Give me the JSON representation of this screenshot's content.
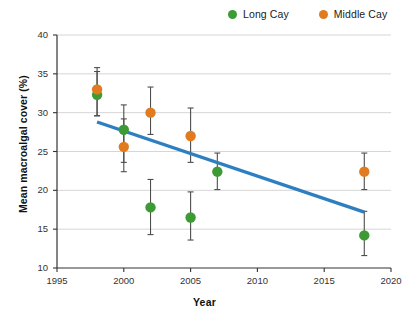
{
  "chart_data": {
    "type": "scatter",
    "title": "",
    "xlabel": "Year",
    "ylabel": "Mean macroalgal cover (%)",
    "xlim": [
      1995,
      2020
    ],
    "ylim": [
      10,
      40
    ],
    "xticks": [
      1995,
      2000,
      2005,
      2010,
      2015,
      2020
    ],
    "yticks": [
      10,
      15,
      20,
      25,
      30,
      35,
      40
    ],
    "grid": "horizontal",
    "legend_position": "top-right",
    "colors": {
      "long_cay": "#3d9b35",
      "middle_cay": "#e07b1f",
      "trendline": "#2e7fc1",
      "errorbar": "#4d4d4d",
      "gridline": "#cccccc",
      "axis": "#333333"
    },
    "series": [
      {
        "name": "Long Cay",
        "color": "#3d9b35",
        "points": [
          {
            "x": 1998,
            "y": 32.3,
            "err_low": 29.6,
            "err_high": 35.3
          },
          {
            "x": 2000,
            "y": 27.8,
            "err_low": 23.6,
            "err_high": 31.0
          },
          {
            "x": 2002,
            "y": 17.8,
            "err_low": 14.3,
            "err_high": 21.4
          },
          {
            "x": 2005,
            "y": 16.5,
            "err_low": 13.6,
            "err_high": 19.8
          },
          {
            "x": 2007,
            "y": 22.4,
            "err_low": 20.1,
            "err_high": 24.8
          },
          {
            "x": 2018,
            "y": 14.2,
            "err_low": 11.6,
            "err_high": 17.3
          }
        ]
      },
      {
        "name": "Middle Cay",
        "color": "#e07b1f",
        "points": [
          {
            "x": 1998,
            "y": 33.0,
            "err_low": 29.6,
            "err_high": 35.8
          },
          {
            "x": 2000,
            "y": 25.6,
            "err_low": 22.4,
            "err_high": 29.2
          },
          {
            "x": 2002,
            "y": 30.0,
            "err_low": 27.2,
            "err_high": 33.3
          },
          {
            "x": 2005,
            "y": 27.0,
            "err_low": 23.6,
            "err_high": 30.6
          },
          {
            "x": 2018,
            "y": 22.4,
            "err_low": 20.1,
            "err_high": 24.8
          }
        ]
      }
    ],
    "trendline": {
      "x_start": 1998,
      "y_start": 28.8,
      "x_end": 2018,
      "y_end": 17.2
    }
  },
  "legend": {
    "entries": [
      {
        "label": "Long Cay",
        "color": "#3d9b35"
      },
      {
        "label": "Middle Cay",
        "color": "#e07b1f"
      }
    ]
  },
  "axes": {
    "x_title": "Year",
    "y_title": "Mean macroalgal cover (%)",
    "x_tick_labels": [
      "1995",
      "2000",
      "2005",
      "2010",
      "2015",
      "2020"
    ],
    "y_tick_labels": [
      "10",
      "15",
      "20",
      "25",
      "30",
      "35",
      "40"
    ]
  }
}
